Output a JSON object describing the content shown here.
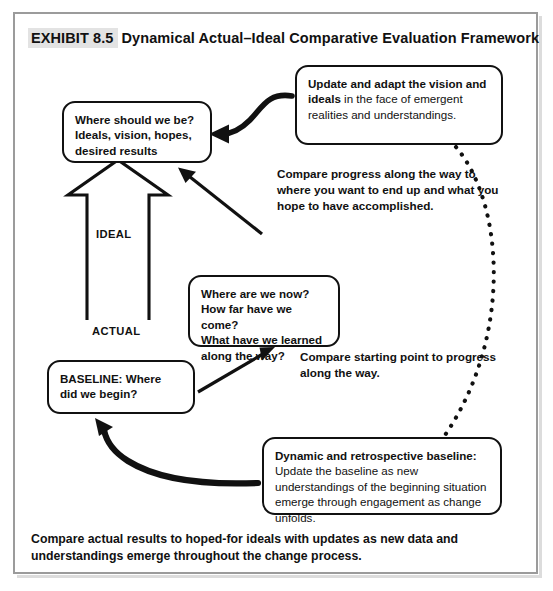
{
  "exhibit": {
    "tag": "EXHIBIT 8.5",
    "title": "Dynamical Actual–Ideal Comparative Evaluation Framework"
  },
  "colors": {
    "frame_border": "#9b9b9b",
    "node_border": "#111111",
    "tag_highlight": "#e3e3e3",
    "ink": "#111111"
  },
  "nodes": {
    "ideal": {
      "line1": "Where should we be?",
      "line2": "Ideals, vision, hopes,",
      "line3": "desired results"
    },
    "update": {
      "bold": "Update and adapt the vision and ideals",
      "rest": " in the face of emergent realities and understandings."
    },
    "now": {
      "line1": "Where are we now?",
      "line2": "How far have we come?",
      "line3": "What have we learned",
      "line4": "along the way?"
    },
    "baseline": {
      "line1": "BASELINE: Where",
      "line2": "did we begin?"
    },
    "dynamic": {
      "bold": "Dynamic and retrospective baseline:",
      "rest": " Update the baseline as new understandings of the beginning situation emerge through engagement as change unfolds."
    }
  },
  "block_arrow": {
    "top_label": "IDEAL",
    "bottom_label": "ACTUAL"
  },
  "annotations": {
    "compare_progress": "Compare progress along the way to where you want to end up and what you hope to have accomplished.",
    "compare_starting": "Compare starting point to progress along the way."
  },
  "caption": "Compare actual results to hoped-for ideals with updates as new data and understandings emerge throughout the change process.",
  "connectors": [
    {
      "name": "curved-arrow-update-to-ideal",
      "style": "solid-thick-curve",
      "direction": "right-to-left"
    },
    {
      "name": "straight-arrow-progress-to-ideal",
      "style": "solid-line",
      "direction": "up-left"
    },
    {
      "name": "straight-arrow-baseline-to-now",
      "style": "solid-line",
      "direction": "up-right"
    },
    {
      "name": "curved-arrow-dynamic-to-baseline",
      "style": "solid-thick-curve",
      "direction": "right-to-left-up"
    },
    {
      "name": "dotted-arc-update-to-dynamic",
      "style": "dotted-arc",
      "direction": "top-to-bottom"
    }
  ]
}
